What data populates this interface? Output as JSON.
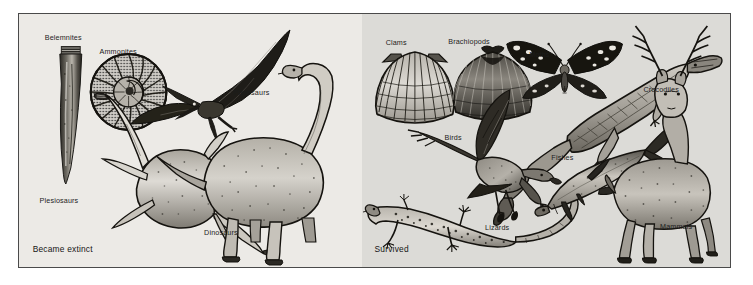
{
  "figure": {
    "background_color": "#ffffff",
    "frame_border_color": "#4a4a4a",
    "ink_color": "#1c1c1c"
  },
  "panels": [
    {
      "id": "extinct",
      "caption": "Became extinct",
      "background_color": "#eceae6",
      "labels": [
        {
          "name": "belemnites",
          "text": "Belemnites",
          "x": 7.5,
          "y": 8.0
        },
        {
          "name": "ammonites",
          "text": "Ammonites",
          "x": 23.5,
          "y": 13.5
        },
        {
          "name": "pterosaurs",
          "text": "Pterosaurs",
          "x": 62.5,
          "y": 29.5
        },
        {
          "name": "plesiosaurs",
          "text": "Plesiosaurs",
          "x": 6.0,
          "y": 72.5
        },
        {
          "name": "dinosaurs",
          "text": "Dinosaurs",
          "x": 54.0,
          "y": 85.0
        }
      ]
    },
    {
      "id": "survived",
      "caption": "Survived",
      "background_color": "#dcdbd7",
      "labels": [
        {
          "name": "clams",
          "text": "Clams",
          "x": 6.5,
          "y": 10.0
        },
        {
          "name": "brachiopods",
          "text": "Brachiopods",
          "x": 23.5,
          "y": 9.5
        },
        {
          "name": "moths",
          "text": "Moths",
          "x": 45.5,
          "y": 14.5
        },
        {
          "name": "crocodiles",
          "text": "Crocodiles",
          "x": 76.5,
          "y": 28.5
        },
        {
          "name": "birds",
          "text": "Birds",
          "x": 22.5,
          "y": 47.5
        },
        {
          "name": "fishes",
          "text": "Fishes",
          "x": 51.5,
          "y": 55.5
        },
        {
          "name": "lizards",
          "text": "Lizards",
          "x": 33.5,
          "y": 83.0
        },
        {
          "name": "mammals",
          "text": "Mammals",
          "x": 81.0,
          "y": 82.5
        }
      ]
    }
  ]
}
